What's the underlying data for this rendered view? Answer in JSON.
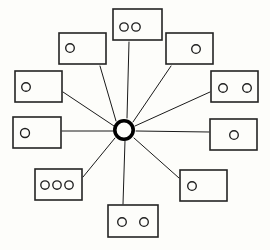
{
  "diagram": {
    "background_color": "#fdfdfa",
    "line_color": "#1a1a1a",
    "node_stroke_color": "#242424",
    "hub_color": "#000000",
    "hub": {
      "label": "central-hub",
      "cx": 124,
      "cy": 130,
      "radius": 9.2,
      "stroke_width": 3.6
    },
    "spoke_count": 10,
    "node_count": 10,
    "total_dots": 14,
    "nodes": [
      {
        "id": "node-top",
        "label": "top",
        "x": 113,
        "y": 9,
        "width": 49,
        "height": 31,
        "dot_count": 2,
        "dots": [
          {
            "cx": 124,
            "cy": 27,
            "r": 4.2
          },
          {
            "cx": 136,
            "cy": 27,
            "r": 4.2
          }
        ],
        "anchor_x": 129,
        "anchor_y": 40
      },
      {
        "id": "node-top-left",
        "label": "top-left",
        "x": 59,
        "y": 33,
        "width": 47,
        "height": 31,
        "dot_count": 1,
        "dots": [
          {
            "cx": 70,
            "cy": 48,
            "r": 4.3
          }
        ],
        "anchor_x": 99,
        "anchor_y": 64
      },
      {
        "id": "node-top-right",
        "label": "top-right",
        "x": 166,
        "y": 33,
        "width": 47,
        "height": 31,
        "dot_count": 1,
        "dots": [
          {
            "cx": 196,
            "cy": 49,
            "r": 4.3
          }
        ],
        "anchor_x": 172,
        "anchor_y": 64
      },
      {
        "id": "node-left-upper",
        "label": "left-upper",
        "x": 15,
        "y": 71,
        "width": 47,
        "height": 31,
        "dot_count": 1,
        "dots": [
          {
            "cx": 26,
            "cy": 87,
            "r": 4.3
          }
        ],
        "anchor_x": 62,
        "anchor_y": 90
      },
      {
        "id": "node-right-upper",
        "label": "right-upper",
        "x": 211,
        "y": 71,
        "width": 47,
        "height": 31,
        "dot_count": 2,
        "dots": [
          {
            "cx": 223,
            "cy": 88,
            "r": 4.3
          },
          {
            "cx": 247,
            "cy": 88,
            "r": 4.3
          }
        ],
        "anchor_x": 211,
        "anchor_y": 90
      },
      {
        "id": "node-left-middle",
        "label": "left-middle",
        "x": 13,
        "y": 117,
        "width": 48,
        "height": 31,
        "dot_count": 1,
        "dots": [
          {
            "cx": 25,
            "cy": 133,
            "r": 4.5
          }
        ],
        "anchor_x": 61,
        "anchor_y": 130
      },
      {
        "id": "node-right-middle",
        "label": "right-middle",
        "x": 210,
        "y": 119,
        "width": 47,
        "height": 31,
        "dot_count": 1,
        "dots": [
          {
            "cx": 234,
            "cy": 135,
            "r": 4.3
          }
        ],
        "anchor_x": 210,
        "anchor_y": 132
      },
      {
        "id": "node-bottom-left",
        "label": "bottom-left",
        "x": 35,
        "y": 169,
        "width": 47,
        "height": 31,
        "dot_count": 3,
        "dots": [
          {
            "cx": 45,
            "cy": 185,
            "r": 4.2
          },
          {
            "cx": 57,
            "cy": 185,
            "r": 4.2
          },
          {
            "cx": 69,
            "cy": 185,
            "r": 4.2
          }
        ],
        "anchor_x": 82,
        "anchor_y": 176
      },
      {
        "id": "node-bottom-right",
        "label": "bottom-right",
        "x": 180,
        "y": 170,
        "width": 47,
        "height": 31,
        "dot_count": 1,
        "dots": [
          {
            "cx": 192,
            "cy": 186,
            "r": 4.3
          }
        ],
        "anchor_x": 180,
        "anchor_y": 177
      },
      {
        "id": "node-bottom",
        "label": "bottom",
        "x": 108,
        "y": 205,
        "width": 50,
        "height": 32,
        "dot_count": 2,
        "dots": [
          {
            "cx": 122,
            "cy": 222,
            "r": 4.3
          },
          {
            "cx": 144,
            "cy": 222,
            "r": 4.3
          }
        ],
        "anchor_x": 122,
        "anchor_y": 205
      }
    ],
    "spokes": [
      {
        "id": "spoke-top",
        "x1": 127,
        "y1": 118,
        "x2": 129,
        "y2": 42
      },
      {
        "id": "spoke-top-left",
        "x1": 116,
        "y1": 121,
        "x2": 100,
        "y2": 66
      },
      {
        "id": "spoke-top-right",
        "x1": 133,
        "y1": 122,
        "x2": 171,
        "y2": 66
      },
      {
        "id": "spoke-left-upper",
        "x1": 114,
        "y1": 126,
        "x2": 63,
        "y2": 92
      },
      {
        "id": "spoke-right-upper",
        "x1": 135,
        "y1": 126,
        "x2": 210,
        "y2": 92
      },
      {
        "id": "spoke-left-middle",
        "x1": 113,
        "y1": 131,
        "x2": 62,
        "y2": 131
      },
      {
        "id": "spoke-right-middle",
        "x1": 136,
        "y1": 131,
        "x2": 209,
        "y2": 132
      },
      {
        "id": "spoke-bottom-left",
        "x1": 115,
        "y1": 138,
        "x2": 83,
        "y2": 177
      },
      {
        "id": "spoke-bottom-right",
        "x1": 134,
        "y1": 138,
        "x2": 179,
        "y2": 178
      },
      {
        "id": "spoke-bottom",
        "x1": 125,
        "y1": 141,
        "x2": 123,
        "y2": 204
      }
    ]
  }
}
